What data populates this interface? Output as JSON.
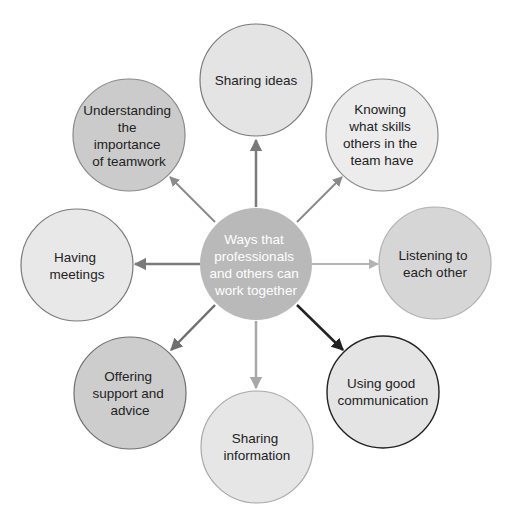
{
  "center": {
    "lines": [
      "Ways that",
      "professionals",
      "and others can",
      "work together"
    ],
    "fill": "#b9b9b9",
    "text_color": "#ffffff"
  },
  "nodes": [
    {
      "id": "sharing-ideas",
      "lines": [
        "Sharing ideas"
      ],
      "fill": "#e4e4e4",
      "stroke": "#7a7a7a",
      "arrow": "#7a7a7a"
    },
    {
      "id": "knowing-skills",
      "lines": [
        "Knowing",
        "what skills",
        "others in the",
        "team have"
      ],
      "fill": "#ececec",
      "stroke": "#8a8a8a",
      "arrow": "#8a8a8a"
    },
    {
      "id": "listening",
      "lines": [
        "Listening to",
        "each other"
      ],
      "fill": "#d6d6d6",
      "stroke": "#b0b0b0",
      "arrow": "#b3b3b3"
    },
    {
      "id": "using-good-communication",
      "lines": [
        "Using good",
        "communication"
      ],
      "fill": "#e4e4e4",
      "stroke": "#222222",
      "arrow": "#222222"
    },
    {
      "id": "sharing-information",
      "lines": [
        "Sharing",
        "information"
      ],
      "fill": "#e6e6e6",
      "stroke": "#a8a8a8",
      "arrow": "#a8a8a8"
    },
    {
      "id": "offering-support",
      "lines": [
        "Offering",
        "support and",
        "advice"
      ],
      "fill": "#cdcdcd",
      "stroke": "#6e6e6e",
      "arrow": "#6e6e6e"
    },
    {
      "id": "having-meetings",
      "lines": [
        "Having",
        "meetings"
      ],
      "fill": "#e8e8e8",
      "stroke": "#7a7a7a",
      "arrow": "#7a7a7a"
    },
    {
      "id": "understanding-teamwork",
      "lines": [
        "Understanding",
        "the",
        "importance",
        "of teamwork"
      ],
      "fill": "#cbcbcb",
      "stroke": "#8a8a8a",
      "arrow": "#8a8a8a"
    }
  ]
}
